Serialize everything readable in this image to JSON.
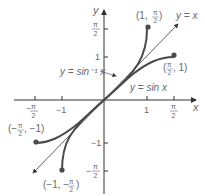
{
  "figure": {
    "axis_labels": {
      "x": "x",
      "y": "y"
    },
    "x_ticks": [
      {
        "num": "π",
        "den": "2",
        "neg": true
      },
      {
        "text": "−1"
      },
      {
        "text": "1"
      },
      {
        "num": "π",
        "den": "2",
        "neg": false
      }
    ],
    "y_ticks": [
      {
        "num": "π",
        "den": "2",
        "neg": false
      },
      {
        "text": "1"
      },
      {
        "text": "−1"
      },
      {
        "num": "π",
        "den": "2",
        "neg": true
      }
    ],
    "curves": [
      {
        "name": "arcsine",
        "label": "y = sin⁻¹ x"
      },
      {
        "name": "sine",
        "label": "y = sin x"
      },
      {
        "name": "identity",
        "label": "y = x"
      }
    ],
    "points": [
      {
        "label_pre": "(1, ",
        "frac_num": "π",
        "frac_den": "2",
        "label_post": ")",
        "neg_frac": false
      },
      {
        "label_pre": "(",
        "frac_num": "π",
        "frac_den": "2",
        "label_post": ", 1)",
        "neg_frac": false
      },
      {
        "label_pre": "(−",
        "frac_num": "π",
        "frac_den": "2",
        "label_post": ", −1)",
        "neg_frac": false
      },
      {
        "label_pre": "(−1, −",
        "frac_num": "π",
        "frac_den": "2",
        "label_post": ")",
        "neg_frac": false
      }
    ],
    "colors": {
      "curve": "#4a4a4a",
      "axis": "#333333",
      "text": "#6a6a6a"
    }
  }
}
